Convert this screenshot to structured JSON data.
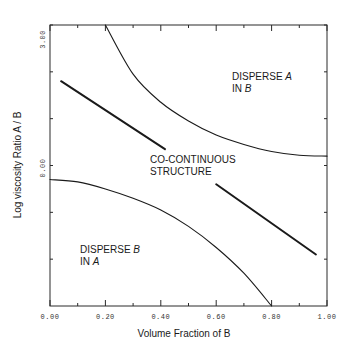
{
  "chart_data": {
    "type": "line",
    "title": "",
    "xlabel": "Volume Fraction of B",
    "ylabel": "Log viscosity Ratio A / B",
    "xlim": [
      0.0,
      1.0
    ],
    "ylim": [
      -3.0,
      3.0
    ],
    "x_tick_labels": [
      "0.00",
      "0.20",
      "0.40",
      "0.60",
      "0.80",
      "1.00"
    ],
    "x_ticks": [
      0.0,
      0.2,
      0.4,
      0.6,
      0.8,
      1.0
    ],
    "x_minor_ticks": [
      0.1,
      0.3,
      0.5,
      0.7,
      0.9
    ],
    "y_tick_labels": [
      "3.00",
      "0.00"
    ],
    "y_ticks": [
      3.0,
      0.0
    ],
    "y_minor_ticks": [
      2.0,
      1.0,
      -1.0,
      -2.0
    ],
    "grid": false,
    "legend": null,
    "series": [
      {
        "name": "upper-boundary-curve",
        "style": "thin",
        "x": [
          0.2,
          0.3,
          0.4,
          0.5,
          0.6,
          0.7,
          0.8,
          0.9,
          1.0
        ],
        "y": [
          3.0,
          1.95,
          1.35,
          0.95,
          0.65,
          0.45,
          0.3,
          0.22,
          0.2
        ]
      },
      {
        "name": "lower-boundary-curve",
        "style": "thin",
        "x": [
          0.0,
          0.1,
          0.2,
          0.3,
          0.4,
          0.5,
          0.6,
          0.7,
          0.8
        ],
        "y": [
          -0.3,
          -0.35,
          -0.5,
          -0.7,
          -0.95,
          -1.3,
          -1.75,
          -2.3,
          -3.0
        ]
      },
      {
        "name": "left-thick-line",
        "style": "thick",
        "x": [
          0.04,
          0.415
        ],
        "y": [
          1.8,
          0.35
        ]
      },
      {
        "name": "right-thick-line",
        "style": "thick",
        "x": [
          0.6,
          0.96
        ],
        "y": [
          -0.4,
          -1.9
        ]
      }
    ],
    "annotations": [
      {
        "text_line1": "DISPERSE ",
        "italic1": "A",
        "text_line2": "IN ",
        "italic2": "B",
        "x": 0.67,
        "y": 2.2
      },
      {
        "text_line1": "CO-CONTINUOUS",
        "text_line2": "STRUCTURE",
        "x": 0.44,
        "y": 0.2
      },
      {
        "text_line1": "DISPERSE ",
        "italic1": "B",
        "text_line2": "IN ",
        "italic2": "A",
        "x": 0.09,
        "y": -1.9
      }
    ]
  },
  "labels": {
    "y_axis": "Log viscosity Ratio A / B",
    "x_axis": "Volume Fraction of B",
    "x_ticks": [
      "0.00",
      "0.20",
      "0.40",
      "0.60",
      "0.80",
      "1.00"
    ],
    "y_top": "3.00",
    "y_mid": "0.00",
    "region_a_in_b": {
      "line1": "DISPERSE ",
      "italic1": "A",
      "line2": "IN ",
      "italic2": "B"
    },
    "region_co": {
      "line1": "CO-CONTINUOUS",
      "line2": "STRUCTURE"
    },
    "region_b_in_a": {
      "line1": "DISPERSE ",
      "italic1": "B",
      "line2": "IN ",
      "italic2": "A"
    }
  }
}
